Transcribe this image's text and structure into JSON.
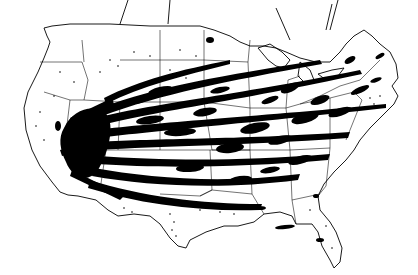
{
  "map": {
    "subject": "United States map with dense black streak tracks",
    "colors": {
      "background": "#ffffff",
      "ink": "#000000"
    },
    "origin_region": "Southwest (southern Nevada / Arizona)",
    "direction": "streaks fan out eastward toward the Atlantic coast",
    "text_labels": []
  }
}
